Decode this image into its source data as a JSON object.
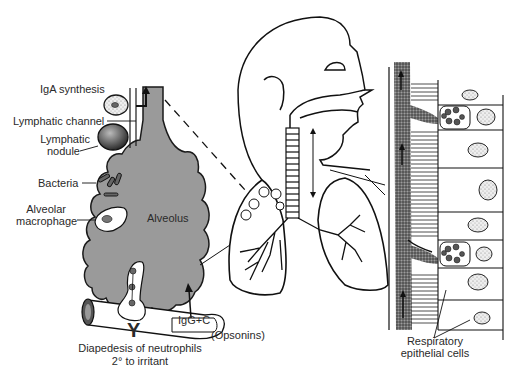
{
  "diagram": {
    "type": "anatomical-illustration",
    "colors": {
      "alveolus_fill": "#9a9a9a",
      "line": "#1a1a1a",
      "background": "#ffffff",
      "mucus_stipple": "#555555"
    },
    "labels": {
      "iga_synthesis": "IgA synthesis",
      "lymphatic_channel": "Lymphatic channel",
      "lymphatic_nodule_line1": "Lymphatic",
      "lymphatic_nodule_line2": "nodule",
      "bacteria": "Bacteria",
      "alveolar_macrophage_line1": "Alveolar",
      "alveolar_macrophage_line2": "macrophage",
      "alveolus": "Alveolus",
      "igg_c": "IgG+C",
      "opsonins": "(Opsonins)",
      "diapedesis_line1": "Diapedesis of neutrophils",
      "diapedesis_line2": "2° to irritant",
      "respiratory_epithelial_line1": "Respiratory",
      "respiratory_epithelial_line2": "epithelial cells",
      "antibody_symbol": "Y"
    }
  }
}
